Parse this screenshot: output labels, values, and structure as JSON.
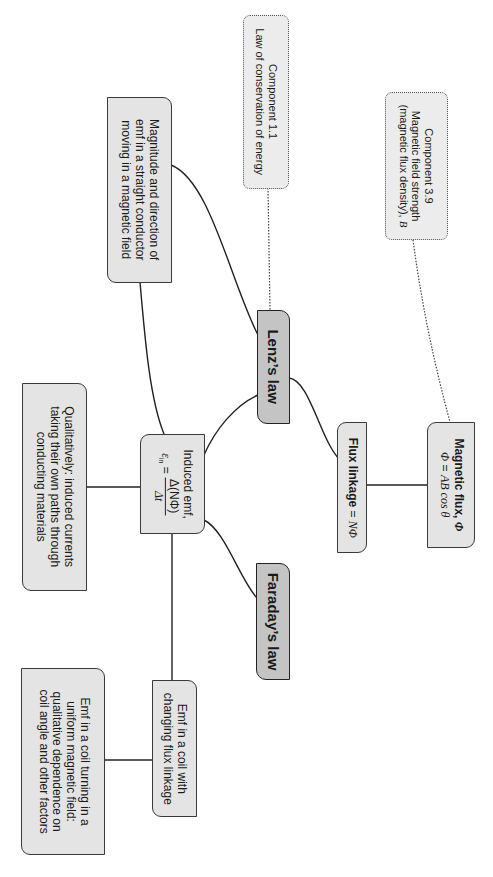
{
  "orientation": "rotated 90 degrees clockwise",
  "nodes": {
    "component_1_1": {
      "line1": "Component 1.1",
      "line2": "Law of conservation of energy"
    },
    "component_3_9": {
      "line1": "Component 3.9",
      "line2": "Magnetic field strength",
      "line3_text": "(magnetic flux density), ",
      "line3_symbol": "B"
    },
    "magnitude": {
      "line1": "Magnitude and direction of",
      "line2": "emf in a straight conductor",
      "line3": "moving in a magnetic field"
    },
    "lenz": {
      "label": "Lenz’s law"
    },
    "flux_linkage": {
      "label_bold": "Flux linkage",
      "label_eq": " = ",
      "label_symbol": "NΦ"
    },
    "magnetic_flux": {
      "title": "Magnetic flux, ",
      "title_symbol": "Φ",
      "eq_lhs": "Φ",
      "eq_mid": " = ",
      "eq_rhs": "AB cos θ"
    },
    "induced_emf": {
      "line1": "Induced emf,",
      "lhs": "ε",
      "lhs_sub": "in",
      "eq": " = ",
      "numerator": "Δ(NΦ)",
      "denominator": "Δt"
    },
    "qualitatively": {
      "line1": "Qualitatively: induced currents",
      "line2": "taking their own paths through",
      "line3": "conducting materials"
    },
    "faraday": {
      "label": "Faraday’s law"
    },
    "emf_changing": {
      "line1": "Emf in a coil with",
      "line2": "changing flux linkage"
    },
    "emf_turning": {
      "line1": "Emf in a coil turning in a",
      "line2": "uniform magnetic field:",
      "line3": "qualitative dependence on",
      "line4": "coil angle and other factors"
    }
  },
  "colors": {
    "box_fill": "#e4e4e4",
    "key_fill": "#c4c4c4",
    "border": "#3a3a3a",
    "link": "#222222"
  }
}
